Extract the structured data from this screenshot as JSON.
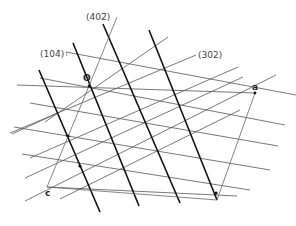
{
  "diagram": {
    "plane_labels": [
      {
        "id": "plane-402bar",
        "text": "(402̅)",
        "display": "(402̄)"
      },
      {
        "id": "plane-104bar",
        "text": "(104̅)",
        "display": "(104̄)"
      },
      {
        "id": "plane-302",
        "text": "(302)",
        "display": "(302)"
      }
    ],
    "points": [
      {
        "id": "origin",
        "label": "O"
      },
      {
        "id": "a-axis",
        "label": "a"
      },
      {
        "id": "c-axis",
        "label": "c"
      }
    ],
    "families": {
      "402bar": {
        "style": "thick",
        "count": 4
      },
      "302": {
        "style": "thin",
        "count": 7
      },
      "104bar": {
        "style": "thin",
        "count": 7
      }
    }
  }
}
